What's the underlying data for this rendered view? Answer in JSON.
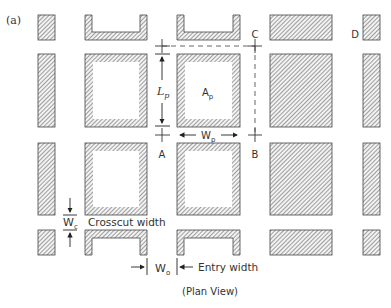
{
  "figure": {
    "panel_label": "(a)",
    "caption": "(Plan View)",
    "colors": {
      "hatch": "#555555",
      "outline": "#444444",
      "background": "#ffffff"
    }
  },
  "points": {
    "A": "A",
    "B": "B",
    "C": "C",
    "D": "D"
  },
  "dimensions": {
    "pillar_length": {
      "symbol": "L",
      "subscript": "p"
    },
    "pillar_width": {
      "symbol": "W",
      "subscript": "p"
    },
    "pillar_area": {
      "symbol": "A",
      "subscript": "p"
    },
    "crosscut_width": {
      "symbol": "W",
      "subscript": "c",
      "label": "Crosscut width"
    },
    "entry_width": {
      "symbol": "W",
      "subscript": "o",
      "label": "Entry width"
    }
  }
}
